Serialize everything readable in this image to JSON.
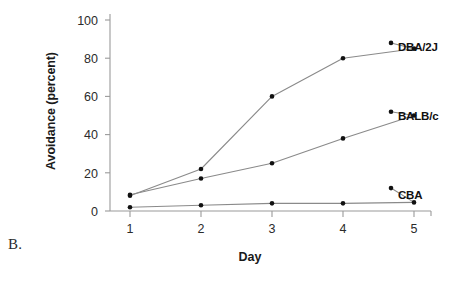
{
  "figure": {
    "panel_label": "B.",
    "background_color": "#ffffff",
    "line_color": "#8a8a8a",
    "marker_color": "#111111",
    "axis_color": "#9a9a9a",
    "text_color": "#1a1a1a"
  },
  "chart_data": {
    "type": "line",
    "title": "",
    "subtitle": "",
    "xlabel": "Day",
    "ylabel": "Avoidance (percent)",
    "categories": [
      1,
      2,
      3,
      4,
      5
    ],
    "x": [
      1,
      2,
      3,
      4,
      5
    ],
    "xtick_labels": [
      "1",
      "2",
      "3",
      "4",
      "5"
    ],
    "ytick_labels": [
      "0",
      "20",
      "40",
      "60",
      "80",
      "100"
    ],
    "yticks": [
      0,
      20,
      40,
      60,
      80,
      100
    ],
    "xlim": [
      0.7,
      5.4
    ],
    "ylim": [
      0,
      100
    ],
    "grid": false,
    "legend_position": "inline-right",
    "series": [
      {
        "name": "DBA/2J",
        "values": [
          8,
          22,
          60,
          80,
          85
        ],
        "label_y_percent": 88
      },
      {
        "name": "BALB/c",
        "values": [
          8.5,
          17,
          25,
          38,
          50
        ],
        "label_y_percent": 52
      },
      {
        "name": "CBA",
        "values": [
          2,
          3,
          4,
          4,
          4.5
        ],
        "label_y_percent": 12
      }
    ]
  }
}
